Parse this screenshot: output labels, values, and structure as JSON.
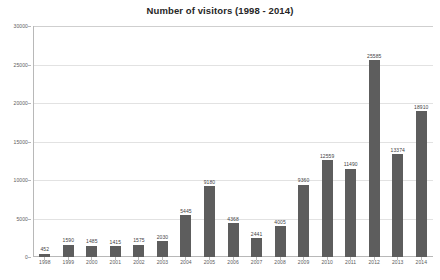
{
  "chart_data": {
    "type": "bar",
    "title": "Number of visitors (1998 - 2014)",
    "xlabel": "",
    "ylabel": "",
    "ylim": [
      0,
      30000
    ],
    "yticks": [
      0,
      5000,
      10000,
      15000,
      20000,
      25000,
      30000
    ],
    "ytick_labels": [
      "0",
      "5000",
      "10000",
      "15000",
      "20000",
      "25000",
      "30000"
    ],
    "grid": true,
    "legend": false,
    "bar_color": "#5d5d5d",
    "categories": [
      "1998",
      "1999",
      "2000",
      "2001",
      "2002",
      "2003",
      "2004",
      "2005",
      "2006",
      "2007",
      "2008",
      "2009",
      "2010",
      "2011",
      "2012",
      "2013",
      "2014"
    ],
    "values": [
      452,
      1590,
      1485,
      1415,
      1575,
      2030,
      5445,
      9180,
      4368,
      2441,
      4005,
      9360,
      12559,
      11490,
      25585,
      13374,
      18910
    ],
    "data_labels": [
      "452",
      "1590",
      "1485",
      "1415",
      "1575",
      "2030",
      "5445",
      "9180",
      "4368",
      "2441",
      "4005",
      "9360",
      "12559",
      "11490",
      "25585",
      "13374",
      "18910"
    ]
  },
  "colors": {
    "bar": "#5d5d5d",
    "axis": "#b8b8b8",
    "gridline": "#e2e2e2",
    "text": "#3f3f3f",
    "title": "#262626",
    "background": "#ffffff"
  }
}
